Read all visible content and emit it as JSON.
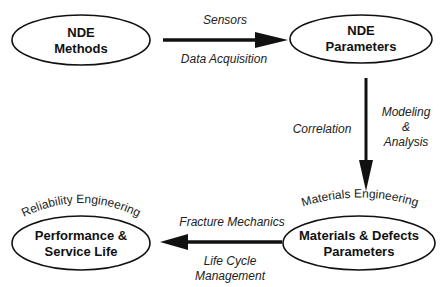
{
  "diagram": {
    "nodes": [
      {
        "id": "nde-methods",
        "lines": [
          "NDE",
          "Methods"
        ],
        "arc_label": ""
      },
      {
        "id": "nde-parameters",
        "lines": [
          "NDE",
          "Parameters"
        ],
        "arc_label": ""
      },
      {
        "id": "materials-defects",
        "lines": [
          "Materials & Defects",
          "Parameters"
        ],
        "arc_label": "Materials Engineering"
      },
      {
        "id": "performance-service-life",
        "lines": [
          "Performance &",
          "Service Life"
        ],
        "arc_label": "Reliability Engineering"
      }
    ],
    "edges": [
      {
        "from": "nde-methods",
        "to": "nde-parameters",
        "label_top": "Sensors",
        "label_bottom": "Data Acquisition"
      },
      {
        "from": "nde-parameters",
        "to": "materials-defects",
        "label_left": "Correlation",
        "label_right": [
          "Modeling",
          "&",
          "Analysis"
        ]
      },
      {
        "from": "materials-defects",
        "to": "performance-service-life",
        "label_top": "Fracture Mechanics",
        "label_bottom": [
          "Life Cycle",
          "Management"
        ]
      }
    ],
    "colors": {
      "stroke": "#111111",
      "background": "#ffffff"
    }
  }
}
